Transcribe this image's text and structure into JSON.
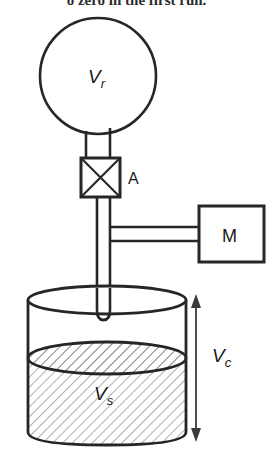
{
  "figure": {
    "type": "apparatus-schematic",
    "title_fragment": "o zero in the first run.",
    "background_color": "#ffffff",
    "stroke_color": "#262626",
    "hatch_color": "#8a8a8a",
    "labels": {
      "reference_volume": "V",
      "reference_volume_sub": "r",
      "valve": "A",
      "manometer": "M",
      "cell_volume": "V",
      "cell_volume_sub": "c",
      "sample_volume": "V",
      "sample_volume_sub": "s"
    },
    "components": [
      {
        "name": "reference-sphere",
        "label": "Vr",
        "shape": "circle"
      },
      {
        "name": "valve",
        "label": "A",
        "shape": "square-with-x"
      },
      {
        "name": "manometer",
        "label": "M",
        "shape": "rectangle"
      },
      {
        "name": "sample-cell",
        "label": "Vc",
        "shape": "cylinder"
      },
      {
        "name": "sample-material",
        "label": "Vs",
        "shape": "hatched-region"
      },
      {
        "name": "dimension-arrow",
        "label": "Vc",
        "shape": "double-arrow"
      }
    ]
  }
}
